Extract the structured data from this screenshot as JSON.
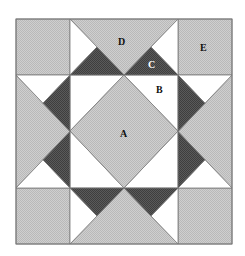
{
  "diagram": {
    "type": "quilt-block",
    "grid_units": 4,
    "colors": {
      "light": "#cfcfcf",
      "light_dot": "#b9b9b9",
      "dark": "#5a5a5a",
      "dark_dot": "#3e3e3e",
      "white": "#ffffff",
      "stroke": "#7a7a7a",
      "label": "#111111",
      "label_on_dark": "#ffffff"
    },
    "labels": {
      "A": "A",
      "B": "B",
      "C": "C",
      "D": "D",
      "E": "E"
    }
  }
}
